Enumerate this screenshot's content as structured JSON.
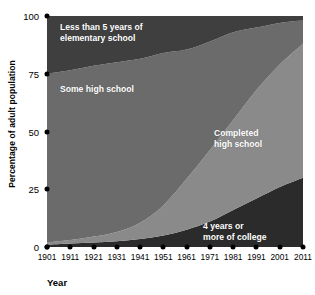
{
  "chart_data": {
    "type": "area",
    "title": "",
    "xlabel": "Year",
    "ylabel": "Percentage of adult population",
    "stacked": true,
    "grid": false,
    "legend_position": "inside-bands",
    "ylim": [
      0,
      100
    ],
    "yticks": [
      0,
      25,
      50,
      75,
      100
    ],
    "ytick_labels": [
      "0",
      "25",
      "50",
      "75",
      "100"
    ],
    "x": [
      1901,
      1911,
      1921,
      1931,
      1941,
      1951,
      1961,
      1971,
      1981,
      1991,
      2001,
      2011
    ],
    "xtick_labels": [
      "1901",
      "1911",
      "1921",
      "1931",
      "1941",
      "1951",
      "1961",
      "1971",
      "1981",
      "1991",
      "2001",
      "2011"
    ],
    "series": [
      {
        "name": "4 years or more of college",
        "label": "4 years or\nmore of college",
        "color": "#2b2b2b",
        "order": 0,
        "values": [
          1,
          1.5,
          2,
          2.5,
          3.5,
          5,
          7.5,
          11,
          16,
          21,
          26,
          30
        ]
      },
      {
        "name": "Completed high school",
        "label": "Completed\nhigh school",
        "color": "#8a8a8a",
        "order": 1,
        "values": [
          1,
          1.5,
          2.5,
          4,
          7,
          13,
          22,
          31,
          39,
          47,
          53,
          58
        ]
      },
      {
        "name": "Some high school",
        "label": "Some high school",
        "color": "#6b6b6b",
        "order": 2,
        "values": [
          73,
          73.5,
          74,
          73.5,
          71,
          66,
          56,
          47,
          38,
          27,
          18,
          10
        ]
      },
      {
        "name": "Less than 5 years of elementary school",
        "label": "Less than 5 years of\nelementary school",
        "color": "#3f3f3f",
        "order": 3,
        "values": [
          25,
          24,
          21.5,
          20,
          18.5,
          16,
          14.5,
          11,
          7,
          5,
          3,
          2
        ]
      }
    ]
  }
}
